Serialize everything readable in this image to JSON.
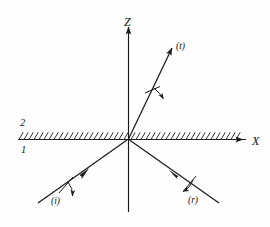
{
  "figure": {
    "type": "optics-ray-diagram",
    "background_color": "#fefefe",
    "ink_color": "#1a1a1a"
  },
  "axes": {
    "vertical": {
      "label": "Z",
      "direction": "up",
      "arrow": true
    },
    "horizontal": {
      "label": "X",
      "direction": "right",
      "arrow": true
    },
    "origin_label": ""
  },
  "interface": {
    "orientation": "horizontal",
    "hatching": "diagonal-ticks-upper-side",
    "medium_above_label": "2",
    "medium_below_label": "1"
  },
  "rays": [
    {
      "id": "incident",
      "label": "(i)",
      "description": "incident ray travelling up-right toward the origin in medium 1",
      "arrow_direction": "toward-origin",
      "polarization_marker": "perpendicular tick with down arrow"
    },
    {
      "id": "reflected",
      "label": "(r)",
      "description": "reflected ray travelling down-right away from the origin in medium 1",
      "arrow_direction": "away-from-origin",
      "polarization_marker": "perpendicular tick with down-left arrow"
    },
    {
      "id": "transmitted",
      "label": "(t)",
      "description": "transmitted ray travelling up-right away from the origin in medium 2",
      "arrow_direction": "away-from-origin",
      "polarization_marker": "perpendicular tick with down-right arrow"
    }
  ]
}
